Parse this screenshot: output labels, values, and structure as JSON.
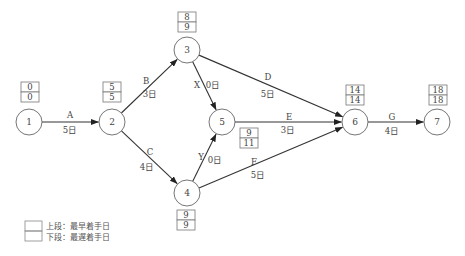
{
  "nodes": [
    {
      "id": "1",
      "label": "1",
      "cx": 29,
      "cy": 122,
      "earliest": "0",
      "latest": "0",
      "box_x": 21,
      "box_y": 82
    },
    {
      "id": "2",
      "label": "2",
      "cx": 112,
      "cy": 122,
      "earliest": "5",
      "latest": "5",
      "box_x": 103,
      "box_y": 82
    },
    {
      "id": "3",
      "label": "3",
      "cx": 187,
      "cy": 50,
      "earliest": "8",
      "latest": "9",
      "box_x": 178,
      "box_y": 12
    },
    {
      "id": "4",
      "label": "4",
      "cx": 187,
      "cy": 193,
      "earliest": "9",
      "latest": "9",
      "box_x": 177,
      "box_y": 210
    },
    {
      "id": "5",
      "label": "5",
      "cx": 222,
      "cy": 122,
      "earliest": "9",
      "latest": "11",
      "box_x": 240,
      "box_y": 128
    },
    {
      "id": "6",
      "label": "6",
      "cx": 355,
      "cy": 122,
      "earliest": "14",
      "latest": "14",
      "box_x": 346,
      "box_y": 85
    },
    {
      "id": "7",
      "label": "7",
      "cx": 437,
      "cy": 122,
      "earliest": "18",
      "latest": "18",
      "box_x": 429,
      "box_y": 85
    }
  ],
  "activities": [
    {
      "name": "A",
      "duration": "5日",
      "from": "1",
      "to": "2",
      "name_pos": [
        70,
        118
      ],
      "dur_pos": [
        70,
        133
      ]
    },
    {
      "name": "B",
      "duration": "3日",
      "from": "2",
      "to": "3",
      "name_pos": [
        146,
        84
      ],
      "dur_pos": [
        150,
        97
      ]
    },
    {
      "name": "C",
      "duration": "4日",
      "from": "2",
      "to": "4",
      "name_pos": [
        150,
        155
      ],
      "dur_pos": [
        147,
        170
      ]
    },
    {
      "name": "X",
      "duration": "0日",
      "from": "3",
      "to": "5",
      "name_pos": [
        197,
        88
      ],
      "dur_pos": [
        213,
        88
      ],
      "dummy": true
    },
    {
      "name": "Y",
      "duration": "0日",
      "from": "4",
      "to": "5",
      "name_pos": [
        201,
        160
      ],
      "dur_pos": [
        215,
        163
      ],
      "dummy": true
    },
    {
      "name": "D",
      "duration": "5日",
      "from": "3",
      "to": "6",
      "name_pos": [
        268,
        80
      ],
      "dur_pos": [
        268,
        97
      ]
    },
    {
      "name": "E",
      "duration": "3日",
      "from": "5",
      "to": "6",
      "name_pos": [
        289,
        120
      ],
      "dur_pos": [
        288,
        133
      ]
    },
    {
      "name": "F",
      "duration": "5日",
      "from": "4",
      "to": "6",
      "name_pos": [
        254,
        165
      ],
      "dur_pos": [
        258,
        178
      ]
    },
    {
      "name": "G",
      "duration": "4日",
      "from": "6",
      "to": "7",
      "name_pos": [
        392,
        120
      ],
      "dur_pos": [
        392,
        134
      ]
    }
  ],
  "legend": {
    "upper": "上段：最早着手日",
    "lower": "下段：最遅着手日"
  },
  "colors": {
    "line": "#333333",
    "circle": "#666666",
    "box": "#777777",
    "text": "#444444"
  }
}
